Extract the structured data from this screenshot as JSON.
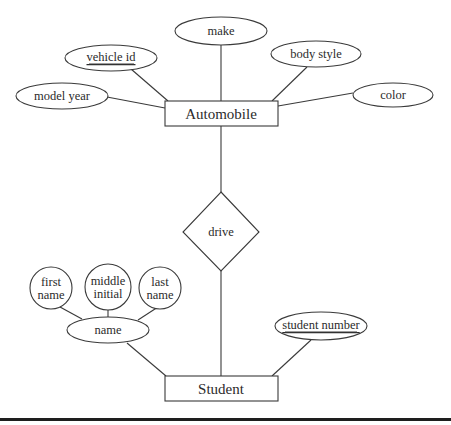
{
  "diagram": {
    "type": "entity-relationship",
    "entities": [
      {
        "id": "automobile",
        "label": "Automobile"
      },
      {
        "id": "student",
        "label": "Student"
      }
    ],
    "relationships": [
      {
        "id": "drive",
        "label": "drive",
        "connects": [
          "automobile",
          "student"
        ]
      }
    ],
    "attributes": {
      "automobile": [
        {
          "id": "model_year",
          "label": "model year",
          "key": false
        },
        {
          "id": "vehicle_id",
          "label": "vehicle id",
          "key": true
        },
        {
          "id": "make",
          "label": "make",
          "key": false
        },
        {
          "id": "body_style",
          "label": "body style",
          "key": false
        },
        {
          "id": "color",
          "label": "color",
          "key": false
        }
      ],
      "student": [
        {
          "id": "name",
          "label": "name",
          "key": false,
          "composite": true,
          "components": [
            {
              "id": "first_name",
              "line1": "first",
              "line2": "name"
            },
            {
              "id": "middle_initial",
              "line1": "middle",
              "line2": "initial"
            },
            {
              "id": "last_name",
              "line1": "last",
              "line2": "name"
            }
          ]
        },
        {
          "id": "student_number",
          "label": "student number",
          "key": true
        }
      ]
    }
  },
  "labels": {
    "automobile": "Automobile",
    "student": "Student",
    "drive": "drive",
    "model_year": "model year",
    "vehicle_id": "vehicle id",
    "make": "make",
    "body_style": "body style",
    "color": "color",
    "name": "name",
    "first_name_1": "first",
    "first_name_2": "name",
    "middle_initial_1": "middle",
    "middle_initial_2": "initial",
    "last_name_1": "last",
    "last_name_2": "name",
    "student_number": "student number"
  },
  "colors": {
    "stroke": "#3a3a3a",
    "text": "#2b2b2b",
    "background": "#ffffff",
    "rule": "#1e1e1e"
  }
}
